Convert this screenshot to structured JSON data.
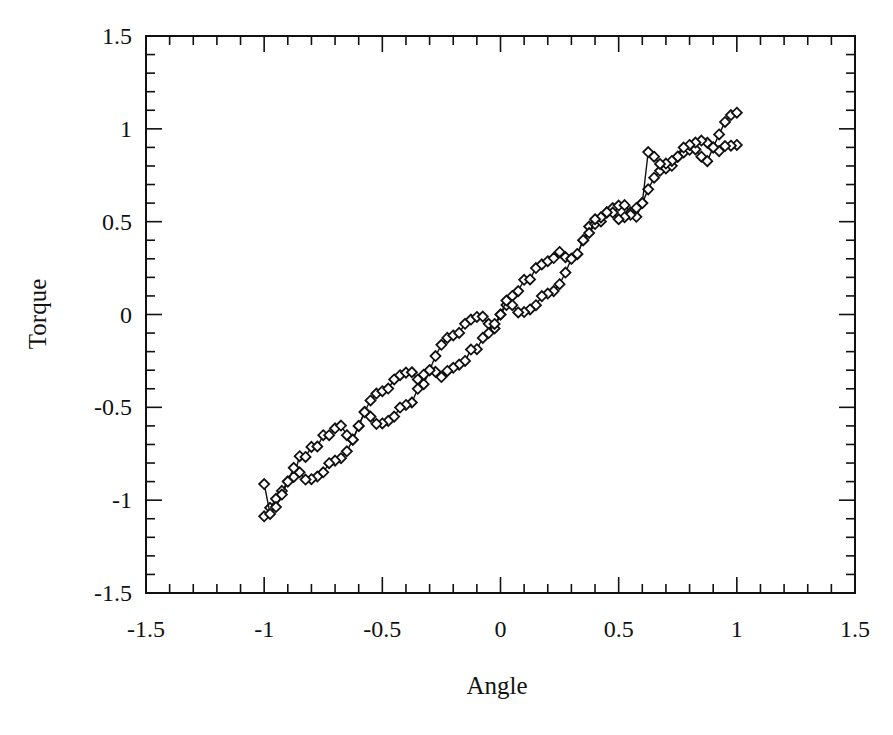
{
  "chart_data": {
    "type": "scatter",
    "title": "",
    "xlabel": "Angle",
    "ylabel": "Torque",
    "xlim": [
      -1.5,
      1.5
    ],
    "ylim": [
      -1.5,
      1.5
    ],
    "x_ticks": [
      -1.5,
      -1,
      -0.5,
      0,
      0.5,
      1,
      1.5
    ],
    "x_tick_labels": [
      "-1.5",
      "-1",
      "-0.5",
      "0",
      "0.5",
      "1",
      "1.5"
    ],
    "y_ticks": [
      -1.5,
      -1,
      -0.5,
      0,
      0.5,
      1,
      1.5
    ],
    "y_tick_labels": [
      "-1.5",
      "-1",
      "-0.5",
      "0",
      "0.5",
      "1",
      "1.5"
    ],
    "minor_tick_step": 0.1,
    "grid": false,
    "legend": null,
    "marker": "diamond-open",
    "line": "thin-solid-connecting",
    "color": "#111111",
    "series": [
      {
        "name": "increasing angle branch",
        "model": "torque = angle + 0.1*sin(pi*angle/0.3)",
        "x": [
          -1.0,
          -0.975,
          -0.95,
          -0.925,
          -0.9,
          -0.875,
          -0.85,
          -0.825,
          -0.8,
          -0.775,
          -0.75,
          -0.725,
          -0.7,
          -0.675,
          -0.65,
          -0.625,
          -0.6,
          -0.575,
          -0.55,
          -0.525,
          -0.5,
          -0.475,
          -0.45,
          -0.425,
          -0.4,
          -0.375,
          -0.35,
          -0.325,
          -0.3,
          -0.275,
          -0.25,
          -0.225,
          -0.2,
          -0.175,
          -0.15,
          -0.125,
          -0.1,
          -0.075,
          -0.05,
          -0.025,
          0.0,
          0.025,
          0.05,
          0.075,
          0.1,
          0.125,
          0.15,
          0.175,
          0.2,
          0.225,
          0.25,
          0.275,
          0.3,
          0.325,
          0.35,
          0.375,
          0.4,
          0.425,
          0.45,
          0.475,
          0.5,
          0.525,
          0.55,
          0.575,
          0.6,
          0.625,
          0.65,
          0.675,
          0.7,
          0.725,
          0.75,
          0.775,
          0.8,
          0.825,
          0.85,
          0.875,
          0.9,
          0.925,
          0.95,
          0.975,
          1.0
        ],
        "y": [
          -1.087,
          -1.041,
          -0.993,
          -0.95,
          -0.9,
          -0.875,
          -0.763,
          -0.767,
          -0.713,
          -0.711,
          -0.65,
          -0.65,
          -0.613,
          -0.598,
          -0.65,
          -0.675,
          -0.6,
          -0.524,
          -0.463,
          -0.426,
          -0.413,
          -0.399,
          -0.35,
          -0.327,
          -0.313,
          -0.311,
          -0.35,
          -0.375,
          -0.3,
          -0.224,
          -0.163,
          -0.126,
          -0.113,
          -0.099,
          -0.05,
          -0.027,
          -0.013,
          -0.011,
          -0.05,
          -0.075,
          0.0,
          0.051,
          0.1,
          0.126,
          0.187,
          0.189,
          0.25,
          0.27,
          0.287,
          0.304,
          0.337,
          0.309,
          0.3,
          0.324,
          0.4,
          0.474,
          0.487,
          0.501,
          0.55,
          0.573,
          0.587,
          0.589,
          0.55,
          0.526,
          0.6,
          0.674,
          0.737,
          0.774,
          0.787,
          0.801,
          0.85,
          0.873,
          0.887,
          0.889,
          0.85,
          0.826,
          0.9,
          0.97,
          1.037,
          1.074,
          1.087
        ]
      },
      {
        "name": "decreasing angle branch",
        "model": "torque = angle - 0.1*sin(pi*angle/0.3)",
        "x": [
          1.0,
          0.975,
          0.95,
          0.925,
          0.9,
          0.875,
          0.85,
          0.825,
          0.8,
          0.775,
          0.75,
          0.725,
          0.7,
          0.675,
          0.65,
          0.625,
          0.6,
          0.575,
          0.55,
          0.525,
          0.5,
          0.475,
          0.45,
          0.425,
          0.4,
          0.375,
          0.35,
          0.325,
          0.3,
          0.275,
          0.25,
          0.225,
          0.2,
          0.175,
          0.15,
          0.125,
          0.1,
          0.075,
          0.05,
          0.025,
          0.0,
          -0.025,
          -0.05,
          -0.075,
          -0.1,
          -0.125,
          -0.15,
          -0.175,
          -0.2,
          -0.225,
          -0.25,
          -0.275,
          -0.3,
          -0.325,
          -0.35,
          -0.375,
          -0.4,
          -0.425,
          -0.45,
          -0.475,
          -0.5,
          -0.525,
          -0.55,
          -0.575,
          -0.6,
          -0.625,
          -0.65,
          -0.675,
          -0.7,
          -0.725,
          -0.75,
          -0.775,
          -0.8,
          -0.825,
          -0.85,
          -0.875,
          -0.9,
          -0.925,
          -0.95,
          -0.975,
          -1.0
        ],
        "y": [
          0.913,
          0.909,
          0.907,
          0.88,
          0.9,
          0.925,
          0.937,
          0.926,
          0.913,
          0.899,
          0.85,
          0.827,
          0.813,
          0.811,
          0.85,
          0.875,
          0.6,
          0.574,
          0.537,
          0.524,
          0.513,
          0.549,
          0.55,
          0.523,
          0.513,
          0.439,
          0.4,
          0.326,
          0.3,
          0.226,
          0.163,
          0.126,
          0.113,
          0.099,
          0.05,
          0.027,
          0.013,
          0.011,
          0.05,
          0.075,
          0.0,
          -0.051,
          -0.1,
          -0.126,
          -0.187,
          -0.189,
          -0.25,
          -0.27,
          -0.287,
          -0.304,
          -0.337,
          -0.309,
          -0.3,
          -0.324,
          -0.4,
          -0.474,
          -0.487,
          -0.501,
          -0.55,
          -0.573,
          -0.587,
          -0.589,
          -0.55,
          -0.526,
          -0.6,
          -0.674,
          -0.737,
          -0.774,
          -0.787,
          -0.801,
          -0.85,
          -0.873,
          -0.887,
          -0.889,
          -0.85,
          -0.826,
          -0.9,
          -0.97,
          -1.037,
          -1.074,
          -0.913
        ]
      }
    ]
  },
  "layout": {
    "plot_box": {
      "left": 146,
      "top": 36,
      "right": 855,
      "bottom": 593
    }
  }
}
